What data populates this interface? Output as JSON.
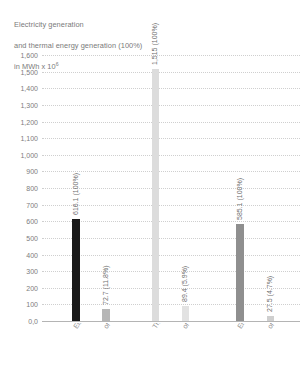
{
  "chart_data": {
    "type": "bar",
    "title": "Electricity generation\nand thermal energy generation (100%)\nin MWh x 10",
    "title_line1": "Electricity generation",
    "title_line2": "and thermal energy generation (100%)",
    "title_line3_prefix": "in MWh x 10",
    "title_exponent": "6",
    "xlabel": "",
    "ylabel": "",
    "ylim": [
      0,
      1600
    ],
    "ytick_step": 100,
    "grid": true,
    "legend": "none",
    "ytick_labels": [
      "1,600",
      "1,500",
      "1,400",
      "1,300",
      "1,200",
      "1,100",
      "1,000",
      "900",
      "800",
      "700",
      "600",
      "500",
      "400",
      "300",
      "200",
      "100",
      "0,0"
    ],
    "ytick_values": [
      1600,
      1500,
      1400,
      1300,
      1200,
      1100,
      1000,
      900,
      800,
      700,
      600,
      500,
      400,
      300,
      200,
      100,
      0
    ],
    "categories": [
      "Electricity generation",
      "of which renewable energies",
      "Thermal energy generation",
      "of which renewable energies",
      "Energy corporation",
      "of which renewable energies"
    ],
    "values": [
      616.1,
      72.7,
      1515,
      89.4,
      585.1,
      27.5
    ],
    "data_labels": [
      "616.1 (100%)",
      "72.7 (11.8%)",
      "1,515 (100%)",
      "89.4 (5.9%)",
      "585.1 (100%)",
      "27.5 (4.7%)"
    ],
    "percentages": [
      "100%",
      "11.8%",
      "100%",
      "5.9%",
      "100%",
      "4.7%"
    ],
    "bar_colors": [
      "#1a1a1a",
      "#b6b6b6",
      "#dcdcdc",
      "#e2e2e2",
      "#8f8f8f",
      "#cfcfcf"
    ]
  },
  "axis_colors": {
    "gridline": "#cfcfcf",
    "baseline": "#b4b4b4",
    "tick_text": "#7d7d7d",
    "title_text": "#7a7a7a"
  }
}
